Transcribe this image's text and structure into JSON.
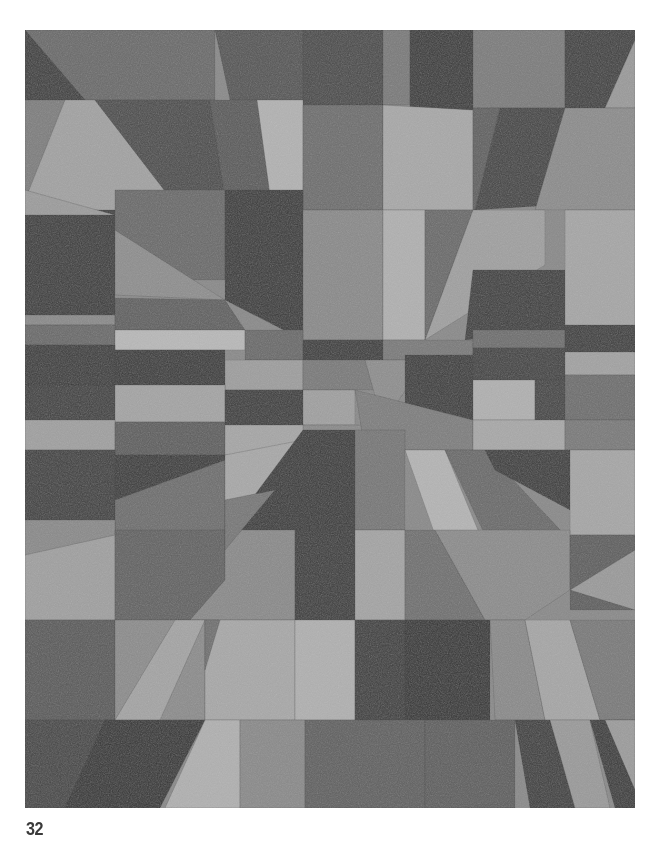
{
  "page": {
    "number": "32",
    "background": "#ffffff"
  },
  "figure": {
    "frame": {
      "x": 25,
      "y": 30,
      "width": 610,
      "height": 778
    },
    "patches": [
      {
        "pts": "0,0 190,0 190,70 0,70",
        "fill": "#6a6a6a"
      },
      {
        "pts": "0,0 60,70 0,70",
        "fill": "#3e3e3e"
      },
      {
        "pts": "190,0 278,0 278,70 205,70",
        "fill": "#555"
      },
      {
        "pts": "278,0 358,0 358,75 278,75",
        "fill": "#4a4a4a"
      },
      {
        "pts": "358,0 385,0 385,75 358,75",
        "fill": "#7a7a7a"
      },
      {
        "pts": "385,0 448,0 448,80 385,80",
        "fill": "#3a3a3a"
      },
      {
        "pts": "448,0 540,0 540,78 448,78",
        "fill": "#7c7c7c"
      },
      {
        "pts": "540,0 610,0 610,10 580,78 540,78",
        "fill": "#404040"
      },
      {
        "pts": "580,78 610,10 610,78",
        "fill": "#9a9a9a"
      },
      {
        "pts": "0,70 70,70 170,200 0,200",
        "fill": "#a2a2a2"
      },
      {
        "pts": "0,70 40,70 0,170",
        "fill": "#7e7e7e"
      },
      {
        "pts": "70,70 185,70 205,200 170,200",
        "fill": "#4c4c4c"
      },
      {
        "pts": "185,70 232,70 255,200 205,200",
        "fill": "#5a5a5a"
      },
      {
        "pts": "232,70 278,70 278,165 245,165",
        "fill": "#b2b2b2"
      },
      {
        "pts": "278,75 358,75 358,180 278,180",
        "fill": "#6e6e6e"
      },
      {
        "pts": "358,75 448,80 448,180 358,180",
        "fill": "#a8a8a8"
      },
      {
        "pts": "448,78 475,78 450,180 448,180",
        "fill": "#606060"
      },
      {
        "pts": "475,78 540,78 530,175 450,180",
        "fill": "#444"
      },
      {
        "pts": "540,78 610,78 610,180 510,180",
        "fill": "#8c8c8c"
      },
      {
        "pts": "0,180 90,180 90,285 0,285",
        "fill": "#3c3c3c"
      },
      {
        "pts": "0,160 90,185 0,185",
        "fill": "#9c9c9c"
      },
      {
        "pts": "90,160 200,160 200,250 90,250",
        "fill": "#6a6a6a"
      },
      {
        "pts": "90,200 200,270 90,265",
        "fill": "#8e8e8e"
      },
      {
        "pts": "200,160 278,160 278,310 200,270",
        "fill": "#3a3a3a"
      },
      {
        "pts": "278,180 358,180 358,310 278,310",
        "fill": "#8a8a8a"
      },
      {
        "pts": "358,180 400,180 400,310 358,310",
        "fill": "#b0b0b0"
      },
      {
        "pts": "400,180 448,180 400,310",
        "fill": "#6a6a6a"
      },
      {
        "pts": "448,180 520,180 520,235 400,310",
        "fill": "#a0a0a0"
      },
      {
        "pts": "448,240 540,240 540,300 440,310",
        "fill": "#3e3e3e"
      },
      {
        "pts": "540,180 610,180 610,300 540,300",
        "fill": "#a6a6a6"
      },
      {
        "pts": "0,285 90,285 90,295 0,295",
        "fill": "#8a8a8a"
      },
      {
        "pts": "90,268 200,270 220,300 90,300",
        "fill": "#606060"
      },
      {
        "pts": "0,295 90,295 90,315 0,315",
        "fill": "#6a6a6a"
      },
      {
        "pts": "90,300 220,300 220,320 90,320",
        "fill": "#b8b8b8"
      },
      {
        "pts": "220,300 278,300 278,330 220,330",
        "fill": "#6a6a6a"
      },
      {
        "pts": "278,310 358,310 358,330 278,330",
        "fill": "#3c3c3c"
      },
      {
        "pts": "358,310 448,310 448,330 358,330",
        "fill": "#7a7a7a"
      },
      {
        "pts": "448,300 540,300 540,318 448,318",
        "fill": "#6e6e6e"
      },
      {
        "pts": "540,295 610,295 610,322 540,322",
        "fill": "#3e3e3e"
      },
      {
        "pts": "0,315 90,315 90,355 0,355",
        "fill": "#3c3c3c"
      },
      {
        "pts": "90,320 200,320 200,355 90,355",
        "fill": "#3a3a3a"
      },
      {
        "pts": "200,330 278,330 278,360 200,360",
        "fill": "#9e9e9e"
      },
      {
        "pts": "278,330 340,330 358,360 278,360",
        "fill": "#7a7a7a"
      },
      {
        "pts": "340,330 400,330 358,395",
        "fill": "#8e8e8e"
      },
      {
        "pts": "380,325 448,325 448,390 380,390",
        "fill": "#3c3c3c"
      },
      {
        "pts": "448,318 540,318 540,350 448,350",
        "fill": "#424242"
      },
      {
        "pts": "540,322 610,322 610,345 540,345",
        "fill": "#a2a2a2"
      },
      {
        "pts": "0,355 90,355 90,390 0,390",
        "fill": "#404040"
      },
      {
        "pts": "90,355 200,355 200,392 90,392",
        "fill": "#a4a4a4"
      },
      {
        "pts": "200,360 278,360 278,395 200,395",
        "fill": "#3c3c3c"
      },
      {
        "pts": "278,360 330,360 330,395 278,395",
        "fill": "#a0a0a0"
      },
      {
        "pts": "448,350 510,350 510,390 448,390",
        "fill": "#b0b0b0"
      },
      {
        "pts": "510,350 540,350 540,390 510,390",
        "fill": "#444"
      },
      {
        "pts": "540,345 610,345 610,390 540,390",
        "fill": "#6e6e6e"
      },
      {
        "pts": "0,390 90,390 90,420 0,420",
        "fill": "#a0a0a0"
      },
      {
        "pts": "90,392 200,392 200,425 90,425",
        "fill": "#5e5e5e"
      },
      {
        "pts": "200,395 278,395 320,420 200,425",
        "fill": "#a6a6a6"
      },
      {
        "pts": "278,395 380,395 300,450 278,420",
        "fill": "#8a8a8a"
      },
      {
        "pts": "330,360 448,390 448,420 340,420",
        "fill": "#7e7e7e"
      },
      {
        "pts": "448,390 540,390 540,420 448,420",
        "fill": "#a8a8a8"
      },
      {
        "pts": "540,390 610,390 610,420 540,420",
        "fill": "#7a7a7a"
      },
      {
        "pts": "0,420 90,420 90,490 0,490",
        "fill": "#404040"
      },
      {
        "pts": "90,425 200,425 200,495 90,495",
        "fill": "#3a3a3a"
      },
      {
        "pts": "90,470 200,430 200,500 90,505",
        "fill": "#6e6e6e"
      },
      {
        "pts": "200,425 278,410 278,430 200,505",
        "fill": "#a8a8a8"
      },
      {
        "pts": "278,400 330,400 330,570 200,505",
        "fill": "#3a3a3a"
      },
      {
        "pts": "330,400 380,400 380,500 330,500",
        "fill": "#777"
      },
      {
        "pts": "380,420 420,420 455,505 410,505",
        "fill": "#b4b4b4"
      },
      {
        "pts": "420,420 460,420 540,505 460,505",
        "fill": "#6a6a6a"
      },
      {
        "pts": "460,420 545,420 545,480 470,440",
        "fill": "#3c3c3c"
      },
      {
        "pts": "545,420 610,420 610,505 545,505",
        "fill": "#a6a6a6"
      },
      {
        "pts": "0,490 90,490 90,520 0,560",
        "fill": "#8a8a8a"
      },
      {
        "pts": "0,525 90,505 90,590 0,590",
        "fill": "#a0a0a0"
      },
      {
        "pts": "90,500 200,500 200,550 165,590 90,590",
        "fill": "#626262"
      },
      {
        "pts": "165,590 200,550 200,500 270,500 270,590",
        "fill": "#8a8a8a"
      },
      {
        "pts": "200,470 250,460 200,520",
        "fill": "#777"
      },
      {
        "pts": "270,500 330,500 330,590 270,590",
        "fill": "#3c3c3c"
      },
      {
        "pts": "330,500 380,500 380,590 330,590",
        "fill": "#a4a4a4"
      },
      {
        "pts": "380,500 410,500 460,590 380,590",
        "fill": "#707070"
      },
      {
        "pts": "410,500 545,500 545,560 500,590 460,590",
        "fill": "#8c8c8c"
      },
      {
        "pts": "545,505 610,505 610,580 545,580",
        "fill": "#5e5e5e"
      },
      {
        "pts": "545,560 610,520 610,580",
        "fill": "#9a9a9a"
      },
      {
        "pts": "0,590 90,590 90,690 0,690",
        "fill": "#5a5a5a"
      },
      {
        "pts": "90,590 180,590 180,690 90,690",
        "fill": "#8c8c8c"
      },
      {
        "pts": "150,590 180,590 135,690 90,690",
        "fill": "#a4a4a4"
      },
      {
        "pts": "180,590 270,590 270,690 180,690",
        "fill": "#a8a8a8"
      },
      {
        "pts": "180,590 195,590 180,640",
        "fill": "#707070"
      },
      {
        "pts": "270,590 330,590 330,690 270,690",
        "fill": "#b0b0b0"
      },
      {
        "pts": "330,590 380,590 380,690 330,690",
        "fill": "#3e3e3e"
      },
      {
        "pts": "380,590 465,590 465,690 380,690",
        "fill": "#353535"
      },
      {
        "pts": "465,590 500,590 520,690 470,690",
        "fill": "#8a8a8a"
      },
      {
        "pts": "500,590 545,590 575,690 520,690",
        "fill": "#a6a6a6"
      },
      {
        "pts": "545,590 610,590 610,690 575,690",
        "fill": "#7a7a7a"
      },
      {
        "pts": "0,690 90,690 90,778 0,778",
        "fill": "#464646"
      },
      {
        "pts": "40,778 80,690 180,690 135,778",
        "fill": "#353535"
      },
      {
        "pts": "180,690 215,690 215,778 140,778",
        "fill": "#b0b0b0"
      },
      {
        "pts": "215,690 280,690 280,778 215,778",
        "fill": "#8a8a8a"
      },
      {
        "pts": "280,690 400,690 400,778 280,778",
        "fill": "#606060"
      },
      {
        "pts": "400,690 490,690 490,778 400,778",
        "fill": "#5e5e5e"
      },
      {
        "pts": "490,690 525,690 550,778 505,778",
        "fill": "#3e3e3e"
      },
      {
        "pts": "525,690 565,690 585,778 550,778",
        "fill": "#9a9a9a"
      },
      {
        "pts": "565,690 610,690 610,778 590,778",
        "fill": "#3a3a3a"
      },
      {
        "pts": "580,690 610,690 610,760",
        "fill": "#9c9c9c"
      }
    ]
  }
}
